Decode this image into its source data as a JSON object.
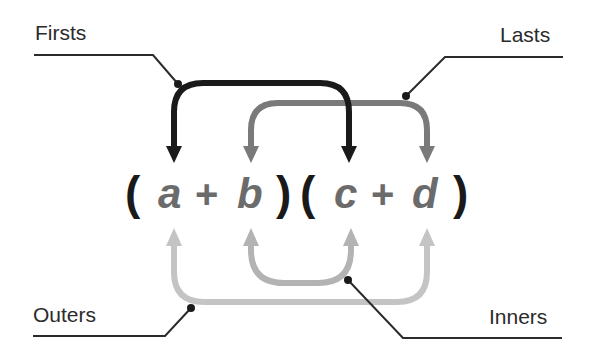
{
  "diagram": {
    "labels": {
      "firsts": "Firsts",
      "lasts": "Lasts",
      "outers": "Outers",
      "inners": "Inners"
    },
    "expression": {
      "open1": "(",
      "a": "a",
      "plus1": "+",
      "b": "b",
      "close1": ")",
      "open2": "(",
      "c": "c",
      "plus2": "+",
      "d": "d",
      "close2": ")"
    },
    "colors": {
      "firsts_arrow": "#1a1a1a",
      "lasts_arrow": "#7a7a7a",
      "outers_arrow": "#bdbdbd",
      "inners_arrow": "#b3b3b3",
      "paren": "#1a1a1a",
      "variables": "#6b6b6b",
      "leader_lines": "#2b2b2b"
    }
  }
}
